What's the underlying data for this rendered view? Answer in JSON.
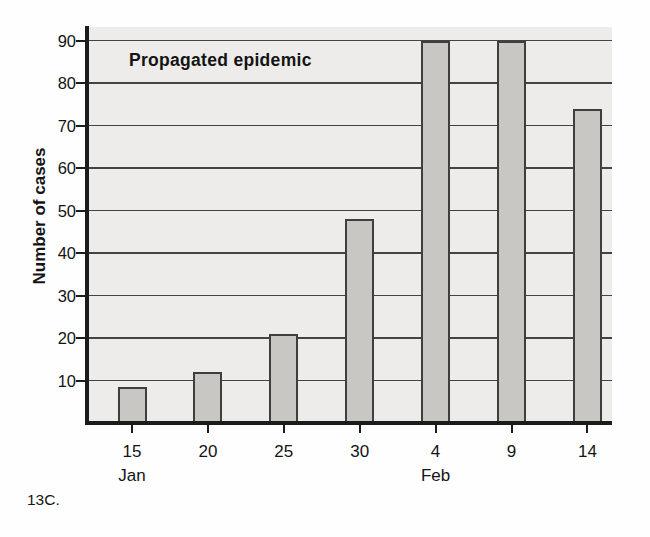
{
  "figure_label": "13C.",
  "chart_data": {
    "type": "bar",
    "title": "Propagated epidemic",
    "xlabel": "",
    "ylabel": "Number of cases",
    "categories": [
      "15",
      "20",
      "25",
      "30",
      "4",
      "9",
      "14"
    ],
    "month_row": [
      {
        "category_index": 0,
        "label": "Jan"
      },
      {
        "category_index": 4,
        "label": "Feb"
      }
    ],
    "values": [
      8.5,
      12,
      21,
      48,
      90,
      90,
      74
    ],
    "ylim": [
      0,
      90
    ],
    "yticks": [
      10,
      20,
      30,
      40,
      50,
      60,
      70,
      80,
      90
    ],
    "grid": "horizontal",
    "legend_position": "none",
    "colors": {
      "bar_fill": "#c8c7c4",
      "bar_border": "#3e3e3e",
      "plot_background": "#edecea",
      "gridline": "#434343",
      "axis": "#1c1c1c",
      "text": "#141414"
    }
  }
}
